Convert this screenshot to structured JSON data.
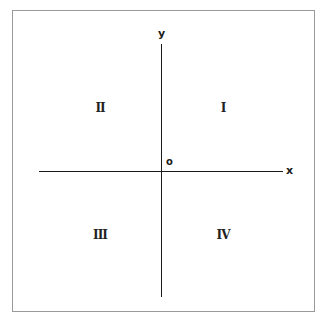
{
  "diagram": {
    "type": "cartesian-plane",
    "axes": {
      "x_label": "x",
      "y_label": "y",
      "origin_label": "o"
    },
    "quadrants": [
      {
        "id": "I",
        "label": "I",
        "position": "top-right"
      },
      {
        "id": "II",
        "label": "II",
        "position": "top-left"
      },
      {
        "id": "III",
        "label": "III",
        "position": "bottom-left"
      },
      {
        "id": "IV",
        "label": "IV",
        "position": "bottom-right"
      }
    ],
    "colors": {
      "axis": "#1a1a1a",
      "frame": "#9a9a9a",
      "background": "#ffffff"
    }
  }
}
